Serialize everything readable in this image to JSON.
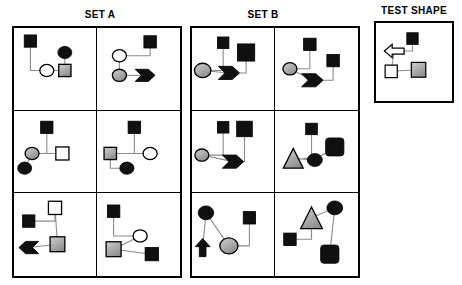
{
  "page": {
    "background": "#ffffff",
    "width": 462,
    "height": 285
  },
  "palette": {
    "black": "#101010",
    "gray": "#a8a8a8",
    "gray_light": "#cfcfcf",
    "white": "#ffffff",
    "outline": "#000000",
    "link": "#8a8a8a"
  },
  "headings": {
    "set_a": "SET A",
    "set_b": "SET B",
    "test_shape": "TEST SHAPE"
  },
  "sets": {
    "a": {
      "label": "SET A",
      "rows": 3,
      "cols": 2,
      "cells": [
        {
          "id": "a1",
          "nodes": [
            {
              "name": "black-square",
              "shape": "square",
              "fill": "black",
              "x": 20,
              "y": 16,
              "size": 15
            },
            {
              "name": "white-circle",
              "shape": "circle",
              "fill": "white",
              "x": 40,
              "y": 52,
              "size": 17
            },
            {
              "name": "gray-square",
              "shape": "square",
              "fill": "gray",
              "x": 62,
              "y": 52,
              "size": 15
            },
            {
              "name": "black-circle",
              "shape": "circle",
              "fill": "black",
              "x": 62,
              "y": 30,
              "size": 17
            }
          ],
          "edges": [
            [
              "black-square",
              "white-circle"
            ],
            [
              "white-circle",
              "gray-square"
            ],
            [
              "gray-square",
              "black-circle"
            ]
          ]
        },
        {
          "id": "a2",
          "nodes": [
            {
              "name": "white-circle",
              "shape": "circle",
              "fill": "white",
              "x": 27,
              "y": 34,
              "size": 17
            },
            {
              "name": "black-square",
              "shape": "square",
              "fill": "black",
              "x": 64,
              "y": 17,
              "size": 15
            },
            {
              "name": "gray-circle",
              "shape": "circle",
              "fill": "gray",
              "x": 27,
              "y": 58,
              "size": 17
            },
            {
              "name": "black-arrow-right",
              "shape": "arrow-right",
              "fill": "black",
              "x": 58,
              "y": 58,
              "size": 24
            }
          ],
          "edges": [
            [
              "white-circle",
              "black-square"
            ],
            [
              "white-circle",
              "gray-circle"
            ],
            [
              "gray-circle",
              "black-arrow-right"
            ]
          ]
        },
        {
          "id": "a3",
          "nodes": [
            {
              "name": "black-square",
              "shape": "square",
              "fill": "black",
              "x": 40,
              "y": 20,
              "size": 15
            },
            {
              "name": "gray-circle",
              "shape": "circle",
              "fill": "gray",
              "x": 22,
              "y": 52,
              "size": 17
            },
            {
              "name": "white-square",
              "shape": "square",
              "fill": "white",
              "x": 59,
              "y": 52,
              "size": 16
            },
            {
              "name": "black-circle",
              "shape": "circle",
              "fill": "black",
              "x": 13,
              "y": 70,
              "size": 17
            }
          ],
          "edges": [
            [
              "black-square",
              "white-square"
            ],
            [
              "gray-circle",
              "white-square"
            ],
            [
              "gray-circle",
              "black-circle"
            ]
          ]
        },
        {
          "id": "a4",
          "nodes": [
            {
              "name": "black-square",
              "shape": "square",
              "fill": "black",
              "x": 45,
              "y": 20,
              "size": 15
            },
            {
              "name": "gray-square",
              "shape": "square",
              "fill": "gray",
              "x": 16,
              "y": 52,
              "size": 15
            },
            {
              "name": "white-circle",
              "shape": "circle",
              "fill": "white",
              "x": 64,
              "y": 52,
              "size": 17
            },
            {
              "name": "black-circle",
              "shape": "circle",
              "fill": "black",
              "x": 36,
              "y": 70,
              "size": 17
            }
          ],
          "edges": [
            [
              "black-square",
              "white-circle"
            ],
            [
              "gray-square",
              "white-circle"
            ],
            [
              "gray-square",
              "black-circle"
            ]
          ]
        },
        {
          "id": "a5",
          "nodes": [
            {
              "name": "white-square",
              "shape": "square",
              "fill": "white",
              "x": 50,
              "y": 18,
              "size": 16
            },
            {
              "name": "black-square",
              "shape": "square",
              "fill": "black",
              "x": 18,
              "y": 34,
              "size": 15
            },
            {
              "name": "gray-square",
              "shape": "square",
              "fill": "gray",
              "x": 53,
              "y": 62,
              "size": 18
            },
            {
              "name": "black-arrow-left",
              "shape": "arrow-left",
              "fill": "black",
              "x": 18,
              "y": 66,
              "size": 24
            }
          ],
          "edges": [
            [
              "black-square",
              "white-square"
            ],
            [
              "white-square",
              "gray-square"
            ],
            [
              "gray-square",
              "black-arrow-left"
            ]
          ]
        },
        {
          "id": "a6",
          "nodes": [
            {
              "name": "black-square",
              "shape": "square",
              "fill": "black",
              "x": 20,
              "y": 22,
              "size": 15
            },
            {
              "name": "white-circle",
              "shape": "circle",
              "fill": "white",
              "x": 52,
              "y": 52,
              "size": 17
            },
            {
              "name": "gray-square",
              "shape": "square",
              "fill": "gray",
              "x": 20,
              "y": 68,
              "size": 18
            },
            {
              "name": "black-square-2",
              "shape": "square",
              "fill": "black",
              "x": 66,
              "y": 74,
              "size": 16
            }
          ],
          "edges": [
            [
              "black-square",
              "white-circle"
            ],
            [
              "white-circle",
              "gray-square"
            ],
            [
              "gray-square",
              "black-square-2"
            ]
          ]
        }
      ]
    },
    "b": {
      "label": "SET B",
      "rows": 3,
      "cols": 2,
      "cells": [
        {
          "id": "b1",
          "nodes": [
            {
              "name": "gray-circle",
              "shape": "circle",
              "fill": "gray",
              "x": 13,
              "y": 52,
              "size": 20
            },
            {
              "name": "black-square-small",
              "shape": "square",
              "fill": "black",
              "x": 38,
              "y": 18,
              "size": 14
            },
            {
              "name": "black-square-large",
              "shape": "square",
              "fill": "black",
              "x": 66,
              "y": 30,
              "size": 21
            },
            {
              "name": "black-arrow-right",
              "shape": "arrow-right",
              "fill": "black",
              "x": 45,
              "y": 55,
              "size": 26
            }
          ],
          "edges": [
            [
              "gray-circle",
              "black-square-small"
            ],
            [
              "gray-circle",
              "black-arrow-right"
            ],
            [
              "black-arrow-right",
              "black-square-large"
            ]
          ]
        },
        {
          "id": "b2",
          "nodes": [
            {
              "name": "gray-circle",
              "shape": "circle",
              "fill": "gray",
              "x": 18,
              "y": 50,
              "size": 17
            },
            {
              "name": "black-square-top",
              "shape": "square",
              "fill": "black",
              "x": 42,
              "y": 20,
              "size": 15
            },
            {
              "name": "black-square-right",
              "shape": "square",
              "fill": "black",
              "x": 70,
              "y": 40,
              "size": 15
            },
            {
              "name": "black-arrow-right",
              "shape": "arrow-right",
              "fill": "black",
              "x": 45,
              "y": 64,
              "size": 26
            }
          ],
          "edges": [
            [
              "gray-circle",
              "black-square-top"
            ],
            [
              "gray-circle",
              "black-arrow-right"
            ],
            [
              "black-arrow-right",
              "black-square-right"
            ]
          ]
        },
        {
          "id": "b3",
          "nodes": [
            {
              "name": "gray-circle",
              "shape": "circle",
              "fill": "gray",
              "x": 12,
              "y": 54,
              "size": 17
            },
            {
              "name": "black-square-small",
              "shape": "square",
              "fill": "black",
              "x": 38,
              "y": 20,
              "size": 14
            },
            {
              "name": "black-square-large",
              "shape": "square",
              "fill": "black",
              "x": 64,
              "y": 22,
              "size": 19
            },
            {
              "name": "black-arrow-right",
              "shape": "arrow-right",
              "fill": "black",
              "x": 50,
              "y": 62,
              "size": 26
            }
          ],
          "edges": [
            [
              "gray-circle",
              "black-square-small"
            ],
            [
              "gray-circle",
              "black-arrow-right"
            ],
            [
              "black-arrow-right",
              "black-square-large"
            ]
          ]
        },
        {
          "id": "b4",
          "nodes": [
            {
              "name": "gray-triangle",
              "shape": "triangle",
              "fill": "gray",
              "x": 22,
              "y": 58,
              "size": 24
            },
            {
              "name": "black-square-small",
              "shape": "square",
              "fill": "black",
              "x": 44,
              "y": 22,
              "size": 14
            },
            {
              "name": "black-circle",
              "shape": "circle",
              "fill": "black",
              "x": 48,
              "y": 60,
              "size": 18
            },
            {
              "name": "black-rounded-square",
              "shape": "rounded-square",
              "fill": "black",
              "x": 72,
              "y": 44,
              "size": 22
            }
          ],
          "edges": [
            [
              "gray-triangle",
              "black-square-small"
            ],
            [
              "gray-triangle",
              "black-circle"
            ],
            [
              "black-circle",
              "black-rounded-square"
            ]
          ]
        },
        {
          "id": "b5",
          "nodes": [
            {
              "name": "black-circle",
              "shape": "circle",
              "fill": "black",
              "x": 17,
              "y": 24,
              "size": 19
            },
            {
              "name": "black-arrow-up",
              "shape": "arrow-up",
              "fill": "black",
              "x": 13,
              "y": 66,
              "size": 22
            },
            {
              "name": "gray-circle",
              "shape": "circle",
              "fill": "gray",
              "x": 45,
              "y": 64,
              "size": 22
            },
            {
              "name": "black-square",
              "shape": "square",
              "fill": "black",
              "x": 70,
              "y": 30,
              "size": 15
            }
          ],
          "edges": [
            [
              "black-circle",
              "black-arrow-up"
            ],
            [
              "black-circle",
              "gray-circle"
            ],
            [
              "gray-circle",
              "black-square"
            ]
          ]
        },
        {
          "id": "b6",
          "nodes": [
            {
              "name": "gray-triangle",
              "shape": "triangle",
              "fill": "gray",
              "x": 44,
              "y": 30,
              "size": 26
            },
            {
              "name": "black-circle",
              "shape": "circle",
              "fill": "black",
              "x": 72,
              "y": 18,
              "size": 19
            },
            {
              "name": "black-square-small",
              "shape": "square",
              "fill": "black",
              "x": 18,
              "y": 56,
              "size": 15
            },
            {
              "name": "black-rounded-square",
              "shape": "rounded-square",
              "fill": "black",
              "x": 66,
              "y": 74,
              "size": 22
            }
          ],
          "edges": [
            [
              "gray-triangle",
              "black-circle"
            ],
            [
              "gray-triangle",
              "black-square-small"
            ],
            [
              "black-circle",
              "black-rounded-square"
            ]
          ]
        }
      ]
    },
    "test": {
      "label": "TEST SHAPE",
      "cells": [
        {
          "id": "t1",
          "nodes": [
            {
              "name": "white-arrow-left",
              "shape": "arrow-left-outline",
              "fill": "white",
              "x": 24,
              "y": 36,
              "size": 26
            },
            {
              "name": "black-square",
              "shape": "square",
              "fill": "black",
              "x": 48,
              "y": 20,
              "size": 15
            },
            {
              "name": "white-square",
              "shape": "square",
              "fill": "white",
              "x": 20,
              "y": 62,
              "size": 16
            },
            {
              "name": "gray-square",
              "shape": "square",
              "fill": "gray",
              "x": 56,
              "y": 60,
              "size": 19
            }
          ],
          "edges": [
            [
              "white-arrow-left",
              "black-square"
            ],
            [
              "white-arrow-left",
              "white-square"
            ],
            [
              "white-square",
              "gray-square"
            ]
          ]
        }
      ]
    }
  }
}
